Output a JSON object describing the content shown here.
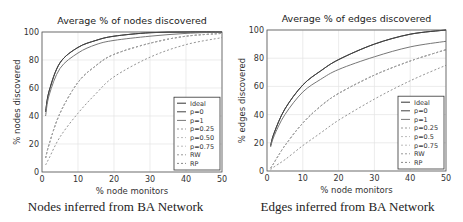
{
  "charts": {
    "left": {
      "title": "Average % of nodes discovered",
      "xlabel": "% node monitors",
      "ylabel": "% nodes discovered",
      "caption": "Nodes inferred from BA Network"
    },
    "right": {
      "title": "Average % of edges discovered",
      "xlabel": "% node monitors",
      "ylabel": "% edges discovered",
      "caption": "Edges inferred from BA Network"
    }
  },
  "chart_data": [
    {
      "type": "line",
      "title": "Average % of nodes discovered",
      "xlabel": "% node monitors",
      "ylabel": "% nodes discovered",
      "caption": "Nodes inferred from BA Network",
      "xlim": [
        0,
        50
      ],
      "ylim": [
        0,
        100
      ],
      "xticks": [
        0,
        10,
        20,
        30,
        40,
        50
      ],
      "yticks": [
        0,
        20,
        40,
        60,
        80,
        100
      ],
      "grid": true,
      "legend_position": "lower right",
      "x": [
        1,
        2,
        5,
        10,
        15,
        20,
        30,
        40,
        50
      ],
      "series": [
        {
          "name": "Ideal",
          "style": "solid",
          "color": "#333333",
          "values": [
            43,
            58,
            78,
            89,
            94,
            97,
            99.5,
            100,
            100
          ]
        },
        {
          "name": "p=0",
          "style": "solid",
          "color": "#444444",
          "values": [
            43,
            58,
            78,
            89,
            94,
            97,
            99.5,
            100,
            100
          ]
        },
        {
          "name": "p=1",
          "style": "solid",
          "color": "#777777",
          "values": [
            40,
            55,
            74,
            85,
            91,
            94,
            97,
            99,
            100
          ]
        },
        {
          "name": "p=0.25",
          "style": "dashed",
          "color": "#999999",
          "values": [
            10,
            20,
            42,
            64,
            76,
            84,
            92,
            97,
            99
          ]
        },
        {
          "name": "p=0.50",
          "style": "dashed",
          "color": "#bbbbbb",
          "values": [
            10,
            20,
            42,
            64,
            76,
            84,
            92,
            97,
            99
          ]
        },
        {
          "name": "p=0.75",
          "style": "dashed",
          "color": "#bbbbbb",
          "values": [
            10,
            20,
            42,
            64,
            76,
            84,
            92,
            97,
            99
          ]
        },
        {
          "name": "RW",
          "style": "dashed",
          "color": "#999999",
          "values": [
            10,
            20,
            42,
            64,
            76,
            84,
            92,
            97,
            99
          ]
        },
        {
          "name": "RP",
          "style": "dashed",
          "color": "#888888",
          "values": [
            5,
            10,
            25,
            42,
            56,
            68,
            82,
            91,
            96
          ]
        }
      ]
    },
    {
      "type": "line",
      "title": "Average % of edges discovered",
      "xlabel": "% node monitors",
      "ylabel": "% edges discovered",
      "caption": "Edges inferred from BA Network",
      "xlim": [
        0,
        50
      ],
      "ylim": [
        0,
        100
      ],
      "xticks": [
        0,
        10,
        20,
        30,
        40,
        50
      ],
      "yticks": [
        0,
        20,
        40,
        60,
        80,
        100
      ],
      "grid": true,
      "legend_position": "lower right",
      "x": [
        1,
        2,
        5,
        10,
        15,
        20,
        30,
        40,
        50
      ],
      "series": [
        {
          "name": "Ideal",
          "style": "solid",
          "color": "#333333",
          "values": [
            18,
            27,
            44,
            61,
            71,
            79,
            90,
            97,
            100
          ]
        },
        {
          "name": "p=0",
          "style": "solid",
          "color": "#444444",
          "values": [
            18,
            27,
            44,
            61,
            71,
            79,
            90,
            97,
            100
          ]
        },
        {
          "name": "p=1",
          "style": "solid",
          "color": "#777777",
          "values": [
            17,
            25,
            40,
            56,
            65,
            72,
            81,
            88,
            92
          ]
        },
        {
          "name": "p=0.25",
          "style": "dashed",
          "color": "#999999",
          "values": [
            2,
            6,
            18,
            34,
            46,
            55,
            68,
            78,
            86
          ]
        },
        {
          "name": "p=0.5",
          "style": "dashed",
          "color": "#bbbbbb",
          "values": [
            2,
            6,
            18,
            34,
            46,
            55,
            68,
            78,
            86
          ]
        },
        {
          "name": "p=0.75",
          "style": "dashed",
          "color": "#bbbbbb",
          "values": [
            2,
            6,
            18,
            34,
            46,
            55,
            68,
            78,
            86
          ]
        },
        {
          "name": "RW",
          "style": "dashed",
          "color": "#999999",
          "values": [
            2,
            6,
            18,
            34,
            46,
            55,
            68,
            78,
            86
          ]
        },
        {
          "name": "RP",
          "style": "dashed",
          "color": "#888888",
          "values": [
            1,
            3,
            8,
            18,
            27,
            36,
            51,
            64,
            75
          ]
        }
      ]
    }
  ]
}
